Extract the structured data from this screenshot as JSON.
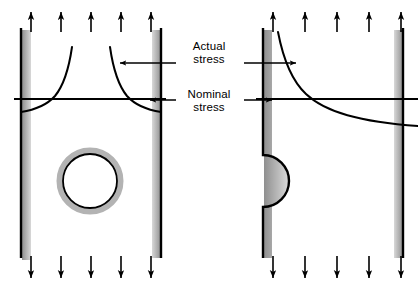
{
  "figure": {
    "type": "engineering-diagram",
    "background_color": "#ffffff",
    "line_color": "#000000",
    "shadow_color": "#9a9a9a",
    "width": 418,
    "height": 289
  },
  "labels": {
    "actual_stress": "Actual\nstress",
    "nominal_stress": "Nominal\nstress"
  },
  "panels": [
    {
      "id": "left-panel",
      "name": "plate-with-central-circular-hole",
      "discontinuity": "circular hole",
      "body": {
        "left": 20,
        "right": 162,
        "top": 28,
        "bottom": 258
      },
      "hole": {
        "cx": 90,
        "cy": 181,
        "r": 27,
        "halo_r": 33
      },
      "nominal_stress_line_y": 99,
      "load_arrows_top": 5,
      "load_arrows_bottom": 5,
      "stress_curve_description": "two mirrored peaks rising steeply at both hole-free edges"
    },
    {
      "id": "right-panel",
      "name": "plate-with-semicircular-edge-notch",
      "discontinuity": "semicircular edge notch",
      "body": {
        "left": 262,
        "right": 404,
        "top": 28,
        "bottom": 258
      },
      "notch": {
        "cx": 262,
        "cy": 181,
        "r": 26
      },
      "nominal_stress_line_y": 99,
      "load_arrows_top": 5,
      "load_arrows_bottom": 5,
      "stress_curve_description": "single peak decaying from notch edge toward far edge"
    }
  ],
  "annotations": [
    {
      "name": "actual-stress-left-arrow",
      "points_to": "left-panel stress curve",
      "direction": "left"
    },
    {
      "name": "actual-stress-right-arrow",
      "points_to": "right-panel stress curve",
      "direction": "right"
    },
    {
      "name": "nominal-stress-left-arrow",
      "points_to": "left-panel nominal line",
      "direction": "left"
    },
    {
      "name": "nominal-stress-right-arrow",
      "points_to": "right-panel nominal line",
      "direction": "right"
    }
  ]
}
